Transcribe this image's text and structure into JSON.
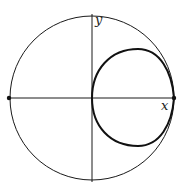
{
  "diagram": {
    "axes": {
      "x_label": "x",
      "y_label": "y"
    },
    "circle": {
      "cx": 92,
      "cy": 98,
      "r": 82
    },
    "points": [
      {
        "name": "left-intersection",
        "x": 9,
        "y": 98
      },
      {
        "name": "right-intersection",
        "x": 174,
        "y": 98
      }
    ],
    "colors": {
      "stroke": "#1a1a1a",
      "curve": "#111111"
    }
  }
}
